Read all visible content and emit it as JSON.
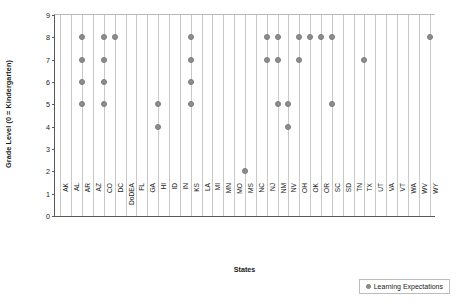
{
  "chart_data": {
    "type": "scatter",
    "title": "",
    "xlabel": "States",
    "ylabel": "Grade Level (0 = Kindergarten)",
    "ylim": [
      0,
      9
    ],
    "yticks": [
      0,
      1,
      2,
      3,
      4,
      5,
      6,
      7,
      8,
      9
    ],
    "grid": "vertical",
    "legend_position": "bottom-right",
    "series": [
      {
        "name": "Learning Expectations",
        "color": "#8d8d8d",
        "marker": "circle"
      }
    ],
    "categories": [
      "AK",
      "AL",
      "AR",
      "AZ",
      "CO",
      "DC",
      "DoDEA",
      "FL",
      "GA",
      "HI",
      "ID",
      "IN",
      "KS",
      "LA",
      "MI",
      "MN",
      "MO",
      "MS",
      "NC",
      "NJ",
      "NM",
      "NV",
      "OH",
      "OK",
      "OR",
      "SC",
      "SD",
      "TN",
      "TX",
      "UT",
      "VA",
      "VT",
      "WA",
      "WV",
      "WY"
    ],
    "points": [
      {
        "state": "AR",
        "values": [
          5,
          6,
          7,
          8
        ]
      },
      {
        "state": "CO",
        "values": [
          5,
          6,
          7,
          8
        ]
      },
      {
        "state": "DC",
        "values": [
          8
        ]
      },
      {
        "state": "HI",
        "values": [
          4,
          5
        ]
      },
      {
        "state": "KS",
        "values": [
          5,
          6,
          7,
          8
        ]
      },
      {
        "state": "MS",
        "values": [
          2
        ]
      },
      {
        "state": "NJ",
        "values": [
          7,
          8
        ]
      },
      {
        "state": "NM",
        "values": [
          5,
          7,
          8
        ]
      },
      {
        "state": "NV",
        "values": [
          4,
          5
        ]
      },
      {
        "state": "OH",
        "values": [
          7,
          8
        ]
      },
      {
        "state": "OK",
        "values": [
          8
        ]
      },
      {
        "state": "OR",
        "values": [
          8
        ]
      },
      {
        "state": "SC",
        "values": [
          5,
          8
        ]
      },
      {
        "state": "TX",
        "values": [
          7
        ]
      },
      {
        "state": "WY",
        "values": [
          8
        ]
      }
    ]
  },
  "legend": {
    "entries": [
      {
        "label": "Learning Expectations"
      }
    ]
  }
}
